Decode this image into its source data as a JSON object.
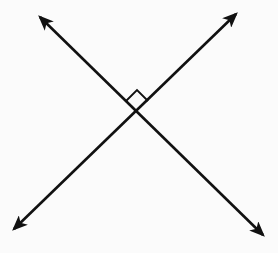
{
  "diagram": {
    "title": "",
    "type": "perpendicular-lines",
    "background": "#fbfbfb",
    "stroke_color": "#111111",
    "lines": [
      {
        "name": "line-a",
        "from": [
          40,
          17
        ],
        "to": [
          263,
          235
        ],
        "arrows": "both"
      },
      {
        "name": "line-b",
        "from": [
          236,
          14
        ],
        "to": [
          14,
          229
        ],
        "arrows": "both"
      }
    ],
    "intersection": [
      137,
      111
    ],
    "right_angle_marker": {
      "points": [
        [
          126,
          101
        ],
        [
          137,
          90
        ],
        [
          148,
          101
        ]
      ],
      "meaning": "right angle (90°)"
    },
    "labels": []
  }
}
